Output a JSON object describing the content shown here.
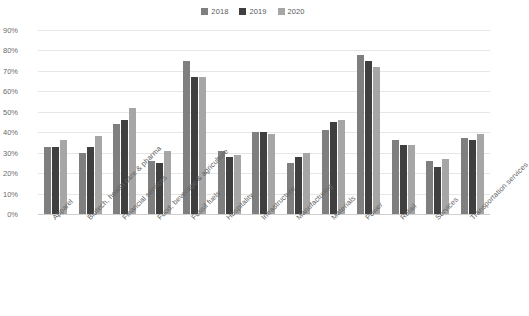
{
  "chart_data": {
    "type": "bar",
    "title": "",
    "subtitle": "",
    "xlabel": "",
    "ylabel": "",
    "ylim": [
      0,
      0.9
    ],
    "grid": true,
    "legend_position": "top-center",
    "y_ticks": [
      "0%",
      "10%",
      "20%",
      "30%",
      "40%",
      "50%",
      "60%",
      "70%",
      "80%",
      "90%"
    ],
    "y_tick_values": [
      0,
      10,
      20,
      30,
      40,
      50,
      60,
      70,
      80,
      90
    ],
    "categories": [
      "Apparel",
      "Biotech, health care & pharma",
      "Financial services",
      "Food, beverage & agriculture",
      "Fossil fuels",
      "Hospitality",
      "Infrastructure",
      "Manufacturing",
      "Materials",
      "Power",
      "Retail",
      "Services",
      "Transportation services"
    ],
    "series": [
      {
        "name": "2018",
        "color": "#7f7f7f",
        "values": [
          33,
          30,
          44,
          26,
          75,
          31,
          40,
          25,
          41,
          78,
          36,
          26,
          37
        ]
      },
      {
        "name": "2019",
        "color": "#3f3f3f",
        "values": [
          33,
          33,
          46,
          25,
          67,
          28,
          40,
          28,
          45,
          75,
          34,
          23,
          36
        ]
      },
      {
        "name": "2020",
        "color": "#a6a6a6",
        "values": [
          36,
          38,
          52,
          31,
          67,
          29,
          39,
          30,
          46,
          72,
          34,
          27,
          39
        ]
      }
    ]
  },
  "colors": {
    "series_2018": "#7f7f7f",
    "series_2019": "#3f3f3f",
    "series_2020": "#a6a6a6",
    "gridline": "#e6e6e6",
    "axis": "#cfcfcf",
    "text": "#636363",
    "background": "#ffffff"
  }
}
